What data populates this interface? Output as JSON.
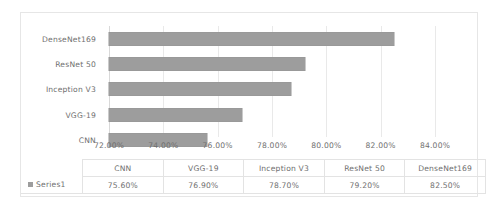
{
  "chart_data": {
    "type": "bar",
    "orientation": "horizontal",
    "title": "",
    "xlabel": "",
    "ylabel": "",
    "categories": [
      "CNN",
      "VGG-19",
      "Inception V3",
      "ResNet 50",
      "DenseNet169"
    ],
    "values": [
      75.6,
      76.9,
      78.7,
      79.2,
      82.5
    ],
    "value_labels": [
      "75.60%",
      "76.90%",
      "78.70%",
      "79.20%",
      "82.50%"
    ],
    "series": [
      {
        "name": "Series1",
        "values": [
          75.6,
          76.9,
          78.7,
          79.2,
          82.5
        ]
      }
    ],
    "xlim": [
      72.0,
      84.0
    ],
    "xticks": [
      72.0,
      74.0,
      76.0,
      78.0,
      80.0,
      82.0,
      84.0
    ],
    "xtick_labels": [
      "72.00%",
      "74.00%",
      "76.00%",
      "78.00%",
      "80.00%",
      "82.00%",
      "84.00%"
    ],
    "grid": true,
    "legend_position": "data-table",
    "bar_color": "#9d9d9d",
    "gridline_color": "#e9e9e9",
    "text_color": "#6f6f6f",
    "border_color": "#e6e6e6"
  },
  "axis": {
    "category_labels_top_to_bottom": [
      "DenseNet169",
      "ResNet 50",
      "Inception V3",
      "VGG-19",
      "CNN"
    ],
    "tick_labels": [
      "72.00%",
      "74.00%",
      "76.00%",
      "78.00%",
      "80.00%",
      "82.00%",
      "84.00%"
    ]
  },
  "table": {
    "corner_blank": "",
    "header": [
      "CNN",
      "VGG-19",
      "Inception V3",
      "ResNet 50",
      "DenseNet169"
    ],
    "series_label": "Series1",
    "row_values": [
      "75.60%",
      "76.90%",
      "78.70%",
      "79.20%",
      "82.50%"
    ]
  }
}
